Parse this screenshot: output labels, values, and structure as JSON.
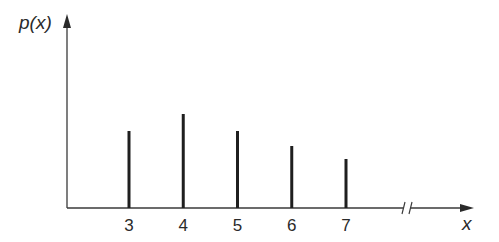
{
  "chart_data": {
    "type": "bar",
    "title": "",
    "xlabel": "x",
    "ylabel": "p(x)",
    "categories": [
      "3",
      "4",
      "5",
      "6",
      "7"
    ],
    "values": [
      77,
      94,
      77,
      62,
      49
    ],
    "value_units": "relative height (no y-axis scale shown)",
    "axis_break_on_x": true,
    "grid": false,
    "legend": null
  },
  "axes": {
    "y_label": "p(x)",
    "x_label": "x"
  },
  "colors": {
    "bars": "#1f1f1f",
    "axes": "#3a3a3a",
    "text": "#2a2a2a"
  }
}
